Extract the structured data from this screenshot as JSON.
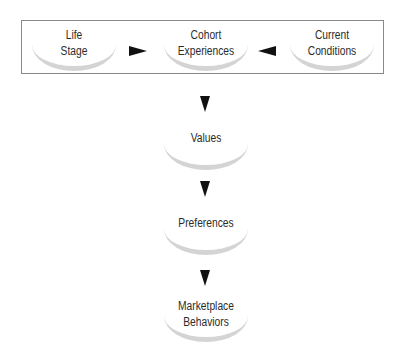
{
  "diagram": {
    "top_row": [
      {
        "id": "life-stage",
        "label": "Life\nStage"
      },
      {
        "id": "cohort-experiences",
        "label": "Cohort\nExperiences"
      },
      {
        "id": "current-conditions",
        "label": "Current\nConditions"
      }
    ],
    "chain": [
      {
        "id": "values",
        "label": "Values"
      },
      {
        "id": "preferences",
        "label": "Preferences"
      },
      {
        "id": "marketplace-behaviors",
        "label": "Marketplace\nBehaviors"
      }
    ],
    "edges": [
      {
        "from": "life-stage",
        "to": "cohort-experiences"
      },
      {
        "from": "current-conditions",
        "to": "cohort-experiences"
      },
      {
        "from": "cohort-experiences",
        "to": "values"
      },
      {
        "from": "values",
        "to": "preferences"
      },
      {
        "from": "preferences",
        "to": "marketplace-behaviors"
      }
    ],
    "colors": {
      "border": "#8a8a8a",
      "arc": "#d4d4d4",
      "arrow": "#111111",
      "text": "#2b2b2b"
    }
  }
}
